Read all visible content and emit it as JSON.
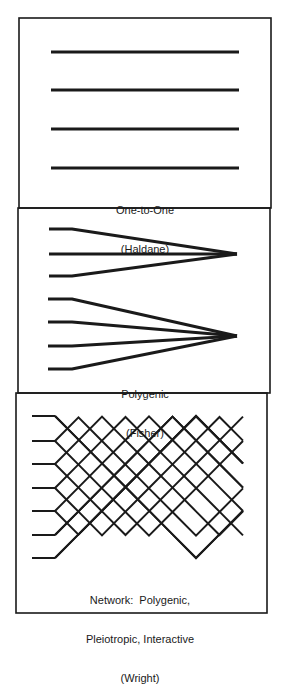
{
  "figure": {
    "stroke_color": "#1a1a1a",
    "background": "#ffffff",
    "panels": [
      {
        "id": "one-to-one",
        "label_line1": "One-to-One",
        "label_line2": "(Haldane)"
      },
      {
        "id": "polygenic",
        "label_line1": "Polygenic",
        "label_line2": "(Fisher)"
      },
      {
        "id": "network",
        "label_line1": "Network:  Polygenic,",
        "label_line2": "Pleiotropic, Interactive",
        "label_line3": "(Wright)"
      }
    ]
  }
}
